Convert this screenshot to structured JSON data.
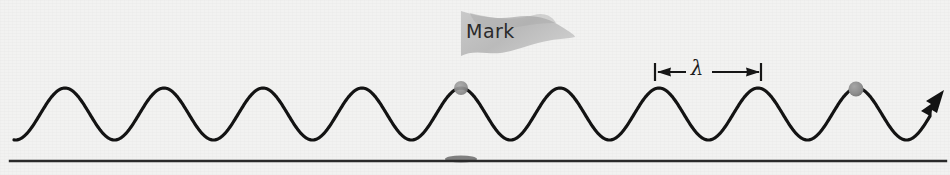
{
  "figure": {
    "background_color": "#f2f2f1",
    "ink_color": "#1c1c1c",
    "accent_gray": "#8f8f8f",
    "flag_fill": "#b8b8b8",
    "pole_color": "#a8a8a8"
  },
  "annotations": {
    "mark_label": "Mark",
    "wavelength_symbol": "λ"
  },
  "icons": {
    "flag": "marker-flag-icon",
    "arrow": "propagation-arrow-icon",
    "dot": "wave-particle-dot-icon"
  },
  "chart_data": {
    "type": "line",
    "xlabel": "",
    "ylabel": "",
    "xlim": [
      0,
      950
    ],
    "ylim": [
      175,
      0
    ],
    "grid": false,
    "legend": null,
    "wave": {
      "description": "Sinusoidal transverse wave travelling to the right",
      "start_x": 14,
      "end_x": 930,
      "midline_y": 114,
      "amplitude": 26,
      "wavelength": 99,
      "crest_phase_x": 65,
      "stroke_width": 3.2,
      "crest_y": 88,
      "trough_y": 140,
      "crest_x_positions": [
        65,
        164,
        263,
        362,
        461,
        560,
        660,
        759,
        858
      ],
      "trough_x_positions": [
        115,
        214,
        313,
        412,
        511,
        610,
        709,
        808,
        907
      ]
    },
    "baseline": {
      "y": 161,
      "x_start": 10,
      "x_end": 946,
      "stroke_width": 2.4,
      "color": "#2a2a2a"
    },
    "flag_marker": {
      "pole_x": 461,
      "pole_top_y": 10,
      "pole_bottom_y": 161,
      "pole_width": 3.5,
      "banner_points": "461,12 500,18 532,14 560,26 572,36 536,42 506,52 476,50 461,55",
      "label": "Mark",
      "label_x": 466,
      "label_y": 38,
      "base_shadow_cx": 461,
      "base_shadow_cy": 159,
      "base_shadow_rx": 16,
      "base_shadow_ry": 3.5,
      "dot_cx": 461,
      "dot_cy": 88,
      "dot_r": 7
    },
    "particle_dot": {
      "cx": 856,
      "cy": 89,
      "r": 7.5,
      "color": "#8f8f8f"
    },
    "wavelength_annotation": {
      "symbol": "λ",
      "left_tick_x": 655,
      "right_tick_x": 761,
      "y": 72,
      "tick_half_height": 9,
      "label_x": 697,
      "value_pixels": 106
    },
    "propagation_arrow": {
      "tip_x": 944,
      "tip_y": 92,
      "angle_deg": -38
    }
  }
}
